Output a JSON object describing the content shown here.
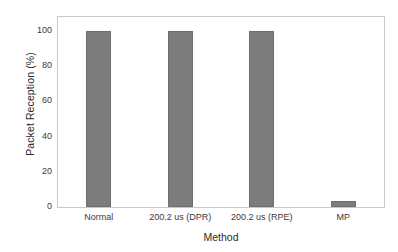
{
  "chart_data": {
    "type": "bar",
    "title": "",
    "subtitle": "",
    "xlabel": "Method",
    "ylabel": "Packet Reception (%)",
    "categories": [
      "Normal",
      "200.2 us (DPR)",
      "200.2 us (RPE)",
      "MP"
    ],
    "values": [
      100,
      99.8,
      100,
      3.5
    ],
    "series": [
      {
        "name": "Packet Reception",
        "values": [
          100,
          99.8,
          100,
          3.5
        ]
      }
    ],
    "ylim": [
      0,
      108
    ],
    "xlim": [
      0,
      4
    ],
    "yticks": [
      0,
      20,
      40,
      60,
      80,
      100
    ],
    "ytick_labels": [
      "0",
      "20",
      "40",
      "60",
      "80",
      "100"
    ],
    "xtick_labels": [
      "Normal",
      "200.2 us (DPR)",
      "200.2 us (RPE)",
      "MP"
    ],
    "grid": false,
    "legend": false,
    "legend_position": "none",
    "annotations": [],
    "colors": {
      "bar_fill": "#7d7d7d",
      "bar_edge": "#6e6e6e",
      "frame": "#c9c9c9",
      "tick": "#9a9a9a",
      "text": "#2b2b2b",
      "background": "#ffffff"
    }
  }
}
